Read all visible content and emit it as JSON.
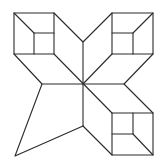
{
  "figure": {
    "stroke_color": "#2a2a2a",
    "background": "#ffffff",
    "width": 166,
    "height": 167,
    "center": [
      83,
      84
    ],
    "shapes": {
      "cube_top_left": {
        "outer": [
          [
            14,
            13
          ],
          [
            54,
            13
          ],
          [
            54,
            54
          ],
          [
            14,
            54
          ]
        ],
        "inner": [
          [
            34,
            33
          ],
          [
            54,
            33
          ],
          [
            54,
            54
          ],
          [
            34,
            54
          ]
        ],
        "diagonal": [
          [
            14,
            13
          ],
          [
            34,
            33
          ]
        ]
      },
      "cube_top_right": {
        "outer": [
          [
            112,
            13
          ],
          [
            153,
            13
          ],
          [
            153,
            54
          ],
          [
            112,
            54
          ]
        ],
        "inner": [
          [
            112,
            33
          ],
          [
            133,
            33
          ],
          [
            133,
            54
          ],
          [
            112,
            54
          ]
        ],
        "diagonal": [
          [
            153,
            13
          ],
          [
            133,
            33
          ]
        ]
      },
      "cube_bottom_right": {
        "outer": [
          [
            112,
            113
          ],
          [
            153,
            113
          ],
          [
            153,
            155
          ],
          [
            112,
            155
          ]
        ],
        "inner": [
          [
            112,
            113
          ],
          [
            133,
            113
          ],
          [
            133,
            134
          ],
          [
            112,
            134
          ]
        ],
        "diagonal": [
          [
            133,
            134
          ],
          [
            153,
            155
          ]
        ]
      },
      "kite_bottom_left": [
        [
          42,
          84
        ],
        [
          15,
          156
        ],
        [
          83,
          126
        ]
      ],
      "star_lines": [
        [
          [
            54,
            13
          ],
          [
            83,
            42
          ]
        ],
        [
          [
            83,
            42
          ],
          [
            112,
            13
          ]
        ],
        [
          [
            83,
            42
          ],
          [
            83,
            84
          ]
        ],
        [
          [
            14,
            54
          ],
          [
            42,
            84
          ]
        ],
        [
          [
            42,
            84
          ],
          [
            83,
            84
          ]
        ],
        [
          [
            54,
            54
          ],
          [
            83,
            84
          ]
        ],
        [
          [
            112,
            54
          ],
          [
            83,
            84
          ]
        ],
        [
          [
            153,
            54
          ],
          [
            124,
            84
          ]
        ],
        [
          [
            124,
            84
          ],
          [
            153,
            113
          ]
        ],
        [
          [
            83,
            84
          ],
          [
            124,
            84
          ]
        ],
        [
          [
            83,
            84
          ],
          [
            112,
            113
          ]
        ],
        [
          [
            83,
            84
          ],
          [
            83,
            126
          ]
        ],
        [
          [
            83,
            126
          ],
          [
            112,
            155
          ]
        ]
      ]
    }
  }
}
